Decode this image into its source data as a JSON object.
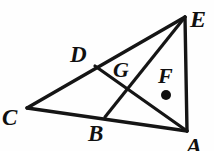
{
  "figure": {
    "background_color": "#fefefe",
    "stroke_color": "#151515",
    "width": 214,
    "height": 151,
    "points": {
      "A": {
        "label": "A",
        "x": 187,
        "y": 131
      },
      "B": {
        "label": "B",
        "x": 105,
        "y": 117
      },
      "C": {
        "label": "C",
        "x": 27,
        "y": 108
      },
      "D": {
        "label": "D",
        "x": 95,
        "y": 66
      },
      "E": {
        "label": "E",
        "x": 185,
        "y": 17
      },
      "F": {
        "label": "F",
        "x": 166,
        "y": 95
      },
      "G": {
        "label": "G",
        "x": 131,
        "y": 90
      }
    },
    "labels": [
      {
        "name": "label-E",
        "text": "E",
        "x": 190,
        "y": 7,
        "size": 24
      },
      {
        "name": "label-D",
        "text": "D",
        "x": 70,
        "y": 43,
        "size": 23
      },
      {
        "name": "label-G",
        "text": "G",
        "x": 113,
        "y": 59,
        "size": 22
      },
      {
        "name": "label-F",
        "text": "F",
        "x": 158,
        "y": 65,
        "size": 22
      },
      {
        "name": "label-C",
        "text": "C",
        "x": 2,
        "y": 106,
        "size": 23
      },
      {
        "name": "label-B",
        "text": "B",
        "x": 88,
        "y": 122,
        "size": 23
      },
      {
        "name": "label-A",
        "text": "A",
        "x": 186,
        "y": 134,
        "size": 24
      }
    ],
    "segments": [
      {
        "name": "segment-CE",
        "from": "C",
        "to": "E",
        "width": 3.4
      },
      {
        "name": "segment-CA",
        "from": "C",
        "to": "A",
        "width": 3.4
      },
      {
        "name": "segment-EA",
        "from": "E",
        "to": "A",
        "width": 3.4
      },
      {
        "name": "segment-EB",
        "from": "E",
        "to": "B",
        "width": 3.2
      },
      {
        "name": "segment-DA",
        "from": "D",
        "to": "A",
        "width": 3.2
      }
    ],
    "marked_point": {
      "name": "point-F-dot",
      "label": "F",
      "x": 166,
      "y": 95,
      "radius": 5,
      "fill": "#101010"
    }
  }
}
